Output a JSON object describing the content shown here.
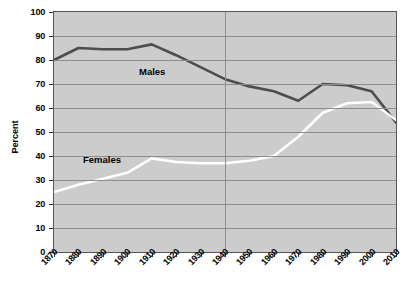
{
  "chart_data": {
    "type": "line",
    "title": "",
    "xlabel": "",
    "ylabel": "Percent",
    "ylim": [
      0,
      100
    ],
    "ytick_step": 10,
    "grid": true,
    "legend_position": "inline-annotation",
    "background_color": "#cccccc",
    "x": [
      1870,
      1880,
      1890,
      1900,
      1910,
      1920,
      1930,
      1940,
      1950,
      1960,
      1970,
      1980,
      1990,
      2000,
      2010
    ],
    "categories": [
      "1870",
      "1880",
      "1890",
      "1900",
      "1910",
      "1920",
      "1930",
      "1940",
      "1950",
      "1960",
      "1970",
      "1980",
      "1990",
      "2000",
      "2010"
    ],
    "yticks": [
      "0",
      "10",
      "20",
      "30",
      "40",
      "50",
      "60",
      "70",
      "80",
      "90",
      "100"
    ],
    "annotations": [
      {
        "text": "Males",
        "x": 1910,
        "y": 74
      },
      {
        "text": "Females",
        "x": 1885,
        "y": 43
      }
    ],
    "reference_line_x": 1940,
    "series": [
      {
        "name": "Males",
        "color": "#4d4d4d",
        "values": [
          80,
          85,
          84.5,
          84.5,
          86.5,
          82,
          77,
          72,
          69,
          67,
          63,
          70,
          69.5,
          67,
          54
        ]
      },
      {
        "name": "Females",
        "color": "#ffffff",
        "values": [
          25,
          28,
          30.5,
          33,
          39,
          37.5,
          37,
          37,
          38,
          40,
          48,
          58,
          62,
          62.5,
          55
        ]
      }
    ]
  }
}
